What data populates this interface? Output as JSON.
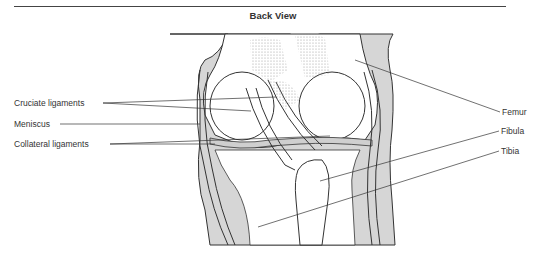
{
  "header": {
    "title": "Back View"
  },
  "labels": {
    "left": [
      {
        "text": "Cruciate ligaments",
        "x": 14,
        "y": 101
      },
      {
        "text": "Meniscus",
        "x": 14,
        "y": 122
      },
      {
        "text": "Collateral ligaments",
        "x": 14,
        "y": 142
      }
    ],
    "right": [
      {
        "text": "Femur",
        "x": 503,
        "y": 109
      },
      {
        "text": "Fibula",
        "x": 501,
        "y": 128
      },
      {
        "text": "Tibia",
        "x": 501,
        "y": 148
      }
    ]
  },
  "colors": {
    "skin": "#d4d4d4",
    "line": "#333333",
    "text": "#333333"
  }
}
